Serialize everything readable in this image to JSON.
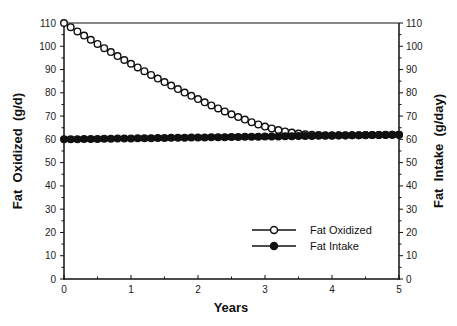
{
  "chart_data": {
    "type": "line",
    "title": "",
    "xlabel": "Years",
    "ylabel_left": "Fat  Oxidized  (g/d)",
    "ylabel_right": "Fat  Intake  (g/day)",
    "xlim": [
      0,
      5
    ],
    "ylim": [
      0,
      110
    ],
    "ylim_right": [
      0,
      110
    ],
    "x_ticks": [
      0,
      1,
      2,
      3,
      4,
      5
    ],
    "y_ticks": [
      0,
      10,
      20,
      30,
      40,
      50,
      60,
      70,
      80,
      90,
      100,
      110
    ],
    "y_ticks_right": [
      0,
      10,
      20,
      30,
      40,
      50,
      60,
      70,
      80,
      90,
      100,
      110
    ],
    "grid": false,
    "legend_position": "lower right",
    "x": [
      0,
      0.1,
      0.2,
      0.3,
      0.4,
      0.5,
      0.6,
      0.7,
      0.8,
      0.9,
      1.0,
      1.1,
      1.2,
      1.3,
      1.4,
      1.5,
      1.6,
      1.7,
      1.8,
      1.9,
      2.0,
      2.1,
      2.2,
      2.3,
      2.4,
      2.5,
      2.6,
      2.7,
      2.8,
      2.9,
      3.0,
      3.1,
      3.2,
      3.3,
      3.4,
      3.5,
      3.6,
      3.7,
      3.8,
      3.9,
      4.0,
      4.1,
      4.2,
      4.3,
      4.4,
      4.5,
      4.6,
      4.7,
      4.8,
      4.9,
      5.0
    ],
    "series": [
      {
        "name": "Fat Oxidized",
        "marker": "open-circle",
        "axis": "left",
        "values": [
          110,
          108.2,
          106.4,
          104.6,
          102.8,
          101.0,
          99.2,
          97.5,
          95.8,
          94.1,
          92.5,
          90.9,
          89.3,
          87.7,
          86.1,
          84.6,
          83.1,
          81.6,
          80.1,
          78.7,
          77.3,
          75.9,
          74.6,
          73.3,
          72.0,
          70.8,
          69.6,
          68.5,
          67.4,
          66.4,
          65.5,
          64.7,
          64.0,
          63.4,
          62.9,
          62.5,
          62.2,
          62.0,
          61.9,
          61.8,
          61.8,
          61.8,
          61.8,
          61.8,
          61.8,
          61.9,
          61.9,
          61.9,
          62.0,
          62.0,
          62.0
        ]
      },
      {
        "name": "Fat Intake",
        "marker": "filled-circle",
        "axis": "right",
        "values": [
          60.0,
          60.04,
          60.08,
          60.12,
          60.16,
          60.2,
          60.24,
          60.28,
          60.32,
          60.36,
          60.4,
          60.44,
          60.48,
          60.52,
          60.56,
          60.6,
          60.64,
          60.68,
          60.72,
          60.76,
          60.8,
          60.84,
          60.88,
          60.92,
          60.96,
          61.0,
          61.04,
          61.08,
          61.12,
          61.16,
          61.2,
          61.24,
          61.28,
          61.32,
          61.36,
          61.4,
          61.44,
          61.48,
          61.52,
          61.56,
          61.6,
          61.64,
          61.68,
          61.72,
          61.76,
          61.8,
          61.84,
          61.88,
          61.92,
          61.96,
          62.0
        ]
      }
    ]
  },
  "legend": {
    "items": [
      {
        "label": "Fat Oxidized",
        "marker": "open-circle"
      },
      {
        "label": "Fat Intake",
        "marker": "filled-circle"
      }
    ]
  },
  "colors": {
    "line": "#111111",
    "background": "#ffffff"
  }
}
